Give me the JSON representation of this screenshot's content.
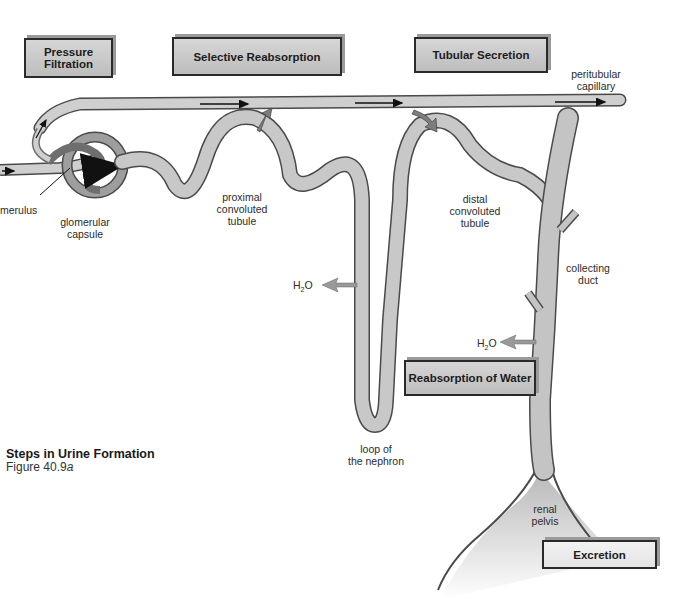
{
  "figure": {
    "title": "Steps in Urine Formation",
    "figure_number": "Figure 40.9",
    "figure_suffix": "a"
  },
  "process_boxes": {
    "pressure_filtration": "Pressure Filtration",
    "selective_reabsorption": "Selective Reabsorption",
    "tubular_secretion": "Tubular Secretion",
    "reabsorption_of_water": "Reabsorption of Water",
    "excretion": "Excretion"
  },
  "structure_labels": {
    "peritubular_capillary": [
      "peritubular",
      "capillary"
    ],
    "glomerulus": "merulus",
    "glomerular_capsule": [
      "glomerular",
      "capsule"
    ],
    "proximal_tubule": [
      "proximal",
      "convoluted",
      "tubule"
    ],
    "distal_tubule": [
      "distal",
      "convoluted",
      "tubule"
    ],
    "collecting_duct": [
      "collecting",
      "duct"
    ],
    "loop": [
      "loop of",
      "the nephron"
    ],
    "renal_pelvis": [
      "renal",
      "pelvis"
    ],
    "water_1": "H2O",
    "water_2": "H2O"
  },
  "colors": {
    "tubule_fill": "#c4c4c4",
    "tubule_stroke": "#4a4a4a",
    "box_fill": "#c8c8c8",
    "arrow_fill": "#8a8a8a"
  }
}
